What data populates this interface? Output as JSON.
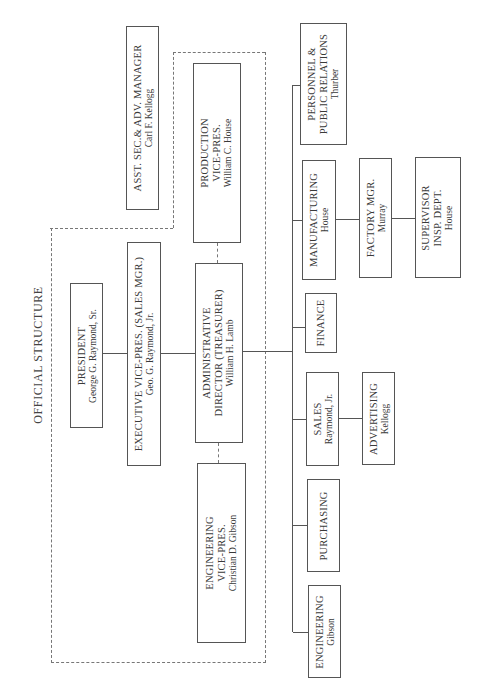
{
  "title": "OFFICIAL STRUCTURE",
  "boxes": {
    "president": {
      "line1": "PRESIDENT",
      "line2": "George G. Raymond, Sr."
    },
    "exec_vp": {
      "line1": "EXECUTIVE VICE-PRES. (SALES MGR.)",
      "line2": "Geo. G. Raymond, Jr."
    },
    "admin_director": {
      "line1": "ADMINISTRATIVE",
      "line1b": "DIRECTOR (TREASURER)",
      "line2": "William H. Lamb"
    },
    "production_vp": {
      "line1": "PRODUCTION",
      "line1b": "VICE-PRES.",
      "line2": "William C. House"
    },
    "engineering_vp": {
      "line1": "ENGINEERING",
      "line1b": "VICE-PRES.",
      "line2": "Christian D. Gibson"
    },
    "asst_sec": {
      "line1": "ASST. SEC.& ADV. MANAGER",
      "line2": "Carl F. Kellogg"
    },
    "personnel": {
      "line1": "PERSONNEL &",
      "line1b": "PUBLIC RELATIONS",
      "line2": "Thurber"
    },
    "manufacturing": {
      "line1": "MANUFACTURING",
      "line2": "House"
    },
    "factory_mgr": {
      "line1": "FACTORY MGR.",
      "line2": "Murray"
    },
    "supervisor": {
      "line1": "SUPERVISOR",
      "line1b": "INSP. DEPT.",
      "line2": "House"
    },
    "finance": {
      "line1": "FINANCE"
    },
    "sales": {
      "line1": "SALES",
      "line2": "Raymond, Jr."
    },
    "advertising": {
      "line1": "ADVERTISING",
      "line2": "Kellogg"
    },
    "purchasing": {
      "line1": "PURCHASING"
    },
    "engineering": {
      "line1": "ENGINEERING",
      "line2": "Gibson"
    }
  }
}
